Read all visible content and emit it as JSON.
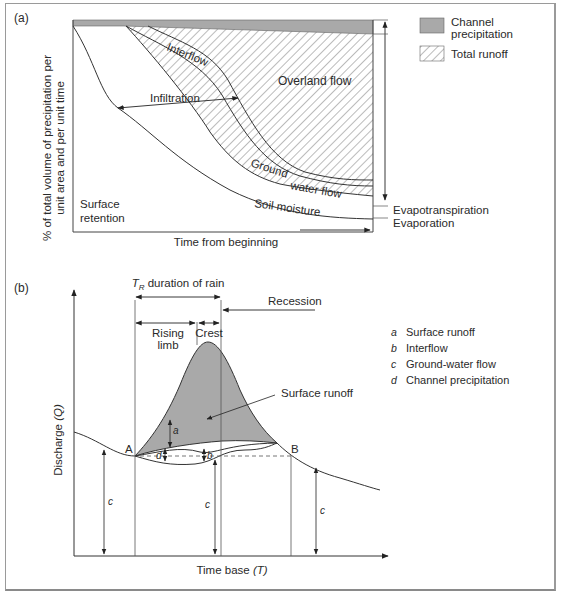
{
  "figure": {
    "panel_a": {
      "label": "(a)",
      "y_axis_label_line1": "% of total volume of precipitation per",
      "y_axis_label_line2": "unit area and per unit time",
      "x_axis_label": "Time from beginning",
      "regions": {
        "interflow": "Interflow",
        "overland_flow": "Overland flow",
        "infiltration": "Infiltration",
        "ground_water_flow_1": "Ground",
        "ground_water_flow_2": "water flow",
        "soil_moisture": "Soil moisture",
        "surface_retention_1": "Surface",
        "surface_retention_2": "retention",
        "evapotranspiration": "Evapotranspiration",
        "evaporation": "Evaporation"
      },
      "legend": [
        {
          "label_line1": "Channel",
          "label_line2": "precipitation",
          "swatch": "solid-grey",
          "color": "#a9a9a9"
        },
        {
          "label_line1": "Total runoff",
          "label_line2": "",
          "swatch": "hatched"
        }
      ]
    },
    "panel_b": {
      "label": "(b)",
      "y_axis_label": "Discharge",
      "y_axis_symbol": "(Q)",
      "x_axis_label": "Time base",
      "x_axis_symbol": "(T)",
      "duration": {
        "symbol": "T",
        "subscript": "R",
        "text": "duration of rain"
      },
      "phases": {
        "rising_limb_1": "Rising",
        "rising_limb_2": "limb",
        "crest": "Crest",
        "recession": "Recession"
      },
      "points": {
        "A": "A",
        "B": "B"
      },
      "surface_runoff_callout": "Surface runoff",
      "component_marks": {
        "a": "a",
        "b": "b",
        "c": "c",
        "d": "d"
      },
      "legend": [
        {
          "key": "a",
          "label": "Surface runoff"
        },
        {
          "key": "b",
          "label": "Interflow"
        },
        {
          "key": "c",
          "label": "Ground-water flow"
        },
        {
          "key": "d",
          "label": "Channel precipitation"
        }
      ],
      "fill_color": "#a9a9a9"
    }
  }
}
